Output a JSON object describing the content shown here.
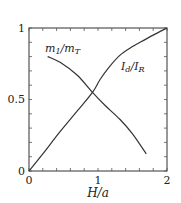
{
  "chart_data": {
    "type": "line",
    "title": "",
    "xlabel": "H/a",
    "ylabel": "",
    "xlim": [
      0,
      2
    ],
    "ylim": [
      0,
      1
    ],
    "grid": false,
    "legend": "inline labels",
    "x_ticks": [
      "0",
      "1",
      "2"
    ],
    "y_ticks": [
      "0",
      "0.5",
      "1"
    ],
    "x_minor_step": 0.2,
    "y_minor_step": 0.1,
    "series": [
      {
        "name": "m1/mT",
        "label_main": "m",
        "label_sub1": "1",
        "label_slash": "/m",
        "label_sub2": "T",
        "x": [
          0.27,
          0.45,
          0.7,
          0.92,
          1.1,
          1.32,
          1.5,
          1.7
        ],
        "y": [
          0.8,
          0.76,
          0.67,
          0.55,
          0.46,
          0.36,
          0.26,
          0.12
        ]
      },
      {
        "name": "Id/IR",
        "label_main": "I",
        "label_sub1": "d",
        "label_slash": "/I",
        "label_sub2": "R",
        "x": [
          0.0,
          0.2,
          0.45,
          0.7,
          0.92,
          1.03,
          1.15,
          1.32,
          1.5,
          1.61,
          1.8,
          2.0
        ],
        "y": [
          0.0,
          0.12,
          0.275,
          0.42,
          0.55,
          0.64,
          0.72,
          0.81,
          0.87,
          0.9,
          0.95,
          1.0
        ]
      }
    ]
  }
}
